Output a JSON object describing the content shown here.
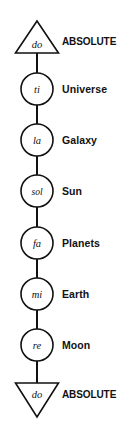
{
  "diagram": {
    "geometry": {
      "width": 129,
      "height": 433,
      "axis_x": 37,
      "label_x": 62,
      "circle_radius": 16,
      "triangle_half_width": 21.5,
      "triangle_height": 32
    },
    "colors": {
      "background": "#ffffff",
      "stroke": "#111111",
      "text": "#111111",
      "shape_fill": "#ffffff"
    },
    "nodes": [
      {
        "id": "node-do-top",
        "note": "do",
        "label": "ABSOLUTE",
        "shape": "triangle-up",
        "center_y": 41,
        "note_y": 44
      },
      {
        "id": "node-ti",
        "note": "ti",
        "label": "Universe",
        "shape": "circle",
        "center_y": 89,
        "note_y": 89
      },
      {
        "id": "node-la",
        "note": "la",
        "label": "Galaxy",
        "shape": "circle",
        "center_y": 140,
        "note_y": 140
      },
      {
        "id": "node-sol",
        "note": "sol",
        "label": "Sun",
        "shape": "circle",
        "center_y": 191,
        "note_y": 191
      },
      {
        "id": "node-fa",
        "note": "fa",
        "label": "Planets",
        "shape": "circle",
        "center_y": 243,
        "note_y": 243
      },
      {
        "id": "node-mi",
        "note": "mi",
        "label": "Earth",
        "shape": "circle",
        "center_y": 294,
        "note_y": 294
      },
      {
        "id": "node-re",
        "note": "re",
        "label": "Moon",
        "shape": "circle",
        "center_y": 345,
        "note_y": 345
      },
      {
        "id": "node-do-bottom",
        "note": "do",
        "label": "ABSOLUTE",
        "shape": "triangle-down",
        "center_y": 398,
        "note_y": 394
      }
    ],
    "connectors": [
      {
        "id": "connector-1",
        "from": "node-do-top",
        "to": "node-ti",
        "y1": 57,
        "y2": 73
      },
      {
        "id": "connector-2",
        "from": "node-ti",
        "to": "node-la",
        "y1": 105,
        "y2": 124
      },
      {
        "id": "connector-3",
        "from": "node-la",
        "to": "node-sol",
        "y1": 156,
        "y2": 175
      },
      {
        "id": "connector-4",
        "from": "node-sol",
        "to": "node-fa",
        "y1": 207,
        "y2": 227
      },
      {
        "id": "connector-5",
        "from": "node-fa",
        "to": "node-mi",
        "y1": 259,
        "y2": 278
      },
      {
        "id": "connector-6",
        "from": "node-mi",
        "to": "node-re",
        "y1": 310,
        "y2": 329
      },
      {
        "id": "connector-7",
        "from": "node-re",
        "to": "node-do-bottom",
        "y1": 361,
        "y2": 382
      }
    ]
  }
}
